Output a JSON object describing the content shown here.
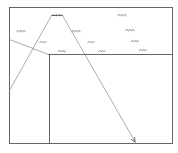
{
  "diagram": {
    "style": {
      "background": "#ffffff",
      "stroke": "#555555",
      "faint_stroke": "#8a8a8a",
      "label_stroke": "#6a6a6a"
    },
    "frame": {
      "x1": 9,
      "y1": 7,
      "x2": 172,
      "y2": 143
    },
    "lines": [
      {
        "id": "mid-horizontal",
        "x1": 48,
        "y1": 54,
        "x2": 172,
        "y2": 54
      },
      {
        "id": "inner-vertical",
        "x1": 49,
        "y1": 54,
        "x2": 49,
        "y2": 143
      },
      {
        "id": "left-diagonal",
        "x1": 9,
        "y1": 39,
        "x2": 48,
        "y2": 54
      },
      {
        "id": "peak-top",
        "x1": 51,
        "y1": 15,
        "x2": 62,
        "y2": 15
      },
      {
        "id": "peak-left-leg",
        "x1": 51,
        "y1": 15,
        "x2": 9,
        "y2": 90
      },
      {
        "id": "peak-right-leg",
        "x1": 62,
        "y1": 15,
        "x2": 135,
        "y2": 142
      }
    ],
    "arrow": {
      "tip_x": 135,
      "tip_y": 142,
      "from_x": 62,
      "from_y": 15
    },
    "scribble_labels": [
      {
        "x": 57,
        "y": 15,
        "w": 10
      },
      {
        "x": 122,
        "y": 15,
        "w": 9
      },
      {
        "x": 21,
        "y": 31,
        "w": 9
      },
      {
        "x": 76,
        "y": 31,
        "w": 9
      },
      {
        "x": 130,
        "y": 30,
        "w": 9
      },
      {
        "x": 43,
        "y": 42,
        "w": 7
      },
      {
        "x": 91,
        "y": 42,
        "w": 7
      },
      {
        "x": 135,
        "y": 41,
        "w": 8
      },
      {
        "x": 62,
        "y": 51,
        "w": 8
      },
      {
        "x": 102,
        "y": 51,
        "w": 7
      },
      {
        "x": 143,
        "y": 50,
        "w": 8
      }
    ]
  }
}
